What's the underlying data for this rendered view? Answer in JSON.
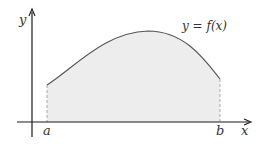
{
  "diagram": {
    "curve_label": "y = f(x)",
    "axes": {
      "x_label": "x",
      "y_label": "y"
    },
    "bounds": {
      "lower_label": "a",
      "upper_label": "b"
    },
    "colors": {
      "axis": "#1a1a1a",
      "curve": "#555555",
      "fill": "#ededed",
      "bound_lines": "#aaaaaa",
      "text": "#333333",
      "background": "#ffffff"
    }
  }
}
